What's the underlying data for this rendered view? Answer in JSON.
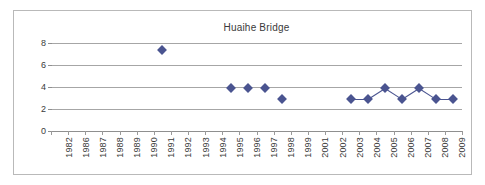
{
  "chart_data": {
    "type": "scatter",
    "title": "Huaihe Bridge",
    "xlabel": "",
    "ylabel": "",
    "ylim": [
      0,
      8
    ],
    "yticks": [
      0,
      2,
      4,
      6,
      8
    ],
    "grid": true,
    "legend": false,
    "categories": [
      "1982",
      "1986",
      "1987",
      "1988",
      "1989",
      "1990",
      "1991",
      "1992",
      "1993",
      "1994",
      "1995",
      "1996",
      "1997",
      "1998",
      "1999",
      "2001",
      "2002",
      "2003",
      "2004",
      "2005",
      "2006",
      "2007",
      "2008",
      "2009"
    ],
    "series": [
      {
        "name": "Huaihe Bridge",
        "marker": "diamond",
        "color": "#4a5490",
        "points": [
          {
            "category": "1991",
            "value": 7.4
          },
          {
            "category": "1995",
            "value": 3.95
          },
          {
            "category": "1996",
            "value": 3.95
          },
          {
            "category": "1997",
            "value": 3.95
          },
          {
            "category": "1998",
            "value": 2.9
          },
          {
            "category": "2003",
            "value": 2.9
          },
          {
            "category": "2004",
            "value": 2.9
          },
          {
            "category": "2005",
            "value": 3.9
          },
          {
            "category": "2006",
            "value": 2.9
          },
          {
            "category": "2007",
            "value": 3.9
          },
          {
            "category": "2008",
            "value": 2.9
          },
          {
            "category": "2009",
            "value": 2.9
          }
        ],
        "connected_runs": [
          [
            "2003",
            "2004",
            "2005",
            "2006",
            "2007",
            "2008",
            "2009"
          ]
        ]
      }
    ]
  },
  "colors": {
    "marker": "#4a5490",
    "gridline": "#a6a6a6",
    "axis": "#8f8f8f",
    "frame": "#b9b9b9",
    "text": "#3a3a3a",
    "background": "#ffffff"
  }
}
